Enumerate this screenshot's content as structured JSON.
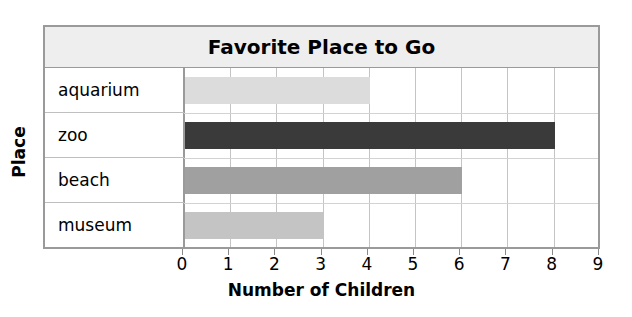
{
  "chart_data": {
    "type": "bar",
    "orientation": "horizontal",
    "title": "Favorite Place to Go",
    "xlabel": "Number of Children",
    "ylabel": "Place",
    "categories": [
      "aquarium",
      "zoo",
      "beach",
      "museum"
    ],
    "values": [
      4,
      8,
      6,
      3
    ],
    "bar_colors": [
      "#dcdcdc",
      "#3a3a3a",
      "#a0a0a0",
      "#c4c4c4"
    ],
    "xlim": [
      0,
      9
    ],
    "xticks": [
      "0",
      "1",
      "2",
      "3",
      "4",
      "5",
      "6",
      "7",
      "8",
      "9"
    ],
    "grid": true,
    "legend": "none",
    "series": [
      {
        "name": "Number of Children",
        "points": [
          {
            "category": "aquarium",
            "value": 4
          },
          {
            "category": "zoo",
            "value": 8
          },
          {
            "category": "beach",
            "value": 6
          },
          {
            "category": "museum",
            "value": 3
          }
        ]
      }
    ]
  },
  "style": {
    "frame_border": "#9a9a9a",
    "title_band_bg": "#eeeeee",
    "grid_color": "#c4c4c4",
    "row_line_color": "#d3d3d3",
    "text_color": "#000000"
  }
}
